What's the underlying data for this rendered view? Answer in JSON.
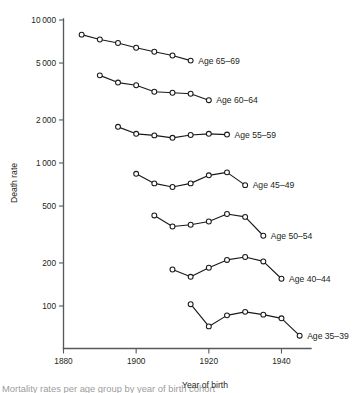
{
  "figure": {
    "y_axis_title": "Death rate",
    "x_axis_title": "Year of birth",
    "caption_partial": "Mortality rates per age group by year of birth cohort"
  },
  "chart_data": {
    "type": "line",
    "title": "",
    "xlabel": "Year of birth",
    "ylabel": "Death rate",
    "xlim": [
      1880,
      1948
    ],
    "ylim": [
      70,
      10000
    ],
    "yscale": "log",
    "grid": false,
    "legend": "inline-right-of-line-end",
    "x_ticks": [
      1880,
      1900,
      1920,
      1940
    ],
    "x_tick_labels": [
      "1880",
      "1900",
      "1920",
      "1940"
    ],
    "y_ticks": [
      100,
      200,
      500,
      1000,
      2000,
      5000,
      10000
    ],
    "y_tick_labels": [
      "100",
      "200",
      "500",
      "1000",
      "2000",
      "5000",
      "10 000"
    ],
    "marker": "open-circle",
    "series": [
      {
        "name": "Age 65-69",
        "label": "Age 65–69",
        "x": [
          1885,
          1890,
          1895,
          1900,
          1905,
          1910,
          1915
        ],
        "values": [
          7900,
          7300,
          6900,
          6400,
          6000,
          5650,
          5200
        ]
      },
      {
        "name": "Age 60-64",
        "label": "Age 60–64",
        "x": [
          1890,
          1895,
          1900,
          1905,
          1910,
          1915,
          1920
        ],
        "values": [
          4100,
          3650,
          3500,
          3150,
          3100,
          3050,
          2750
        ]
      },
      {
        "name": "Age 55-59",
        "label": "Age 55–59",
        "x": [
          1895,
          1900,
          1905,
          1910,
          1915,
          1920,
          1925
        ],
        "values": [
          1790,
          1600,
          1560,
          1500,
          1570,
          1600,
          1580
        ]
      },
      {
        "name": "Age 45-49",
        "label": "Age 45–49",
        "x": [
          1900,
          1905,
          1910,
          1915,
          1920,
          1925,
          1930
        ],
        "values": [
          840,
          720,
          680,
          720,
          820,
          860,
          700
        ]
      },
      {
        "name": "Age 50-54",
        "label": "Age 50–54",
        "x": [
          1905,
          1910,
          1915,
          1920,
          1925,
          1930,
          1935
        ],
        "values": [
          430,
          360,
          370,
          390,
          440,
          420,
          310
        ]
      },
      {
        "name": "Age 40-44",
        "label": "Age 40–44",
        "x": [
          1910,
          1915,
          1920,
          1925,
          1930,
          1935,
          1940
        ],
        "values": [
          180,
          160,
          185,
          210,
          220,
          205,
          155
        ]
      },
      {
        "name": "Age 35-39",
        "label": "Age 35–39",
        "x": [
          1915,
          1920,
          1925,
          1930,
          1935,
          1940,
          1945
        ],
        "values": [
          103,
          72,
          86,
          91,
          87,
          82,
          62
        ]
      }
    ]
  }
}
